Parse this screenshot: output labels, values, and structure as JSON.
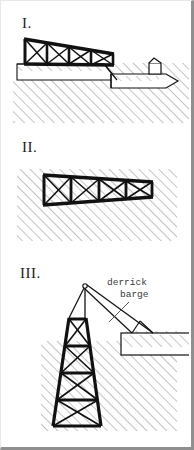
{
  "figure": {
    "background_color": "#ffffff",
    "frame_color": "#8f8f8f",
    "ink_color": "#111111",
    "hatch_color": "#9a9a9a"
  },
  "panels": [
    {
      "id": "panel-1",
      "label": "I.",
      "caption": "",
      "stage": "jacket-launch-from-barge",
      "elements": {
        "truss_bays": 4,
        "truss_bracing": "X-brace",
        "vessel": "launch barge",
        "seabed_hatched": true
      }
    },
    {
      "id": "panel-2",
      "label": "II.",
      "caption": "",
      "stage": "jacket-floating-on-seabed",
      "elements": {
        "truss_bays": 4,
        "truss_bracing": "X-brace",
        "seabed_hatched": true
      }
    },
    {
      "id": "panel-3",
      "label": "III.",
      "caption": "derrick\n  barge",
      "stage": "jacket-upending-by-derrick-barge",
      "elements": {
        "tower_bays": 4,
        "tower_bracing": "X-brace",
        "vessel": "derrick barge",
        "crane": "boom with lifting sling",
        "seabed_hatched": true
      }
    }
  ],
  "annotations": {
    "derrick_barge_line1": "derrick",
    "derrick_barge_line2": "barge"
  }
}
